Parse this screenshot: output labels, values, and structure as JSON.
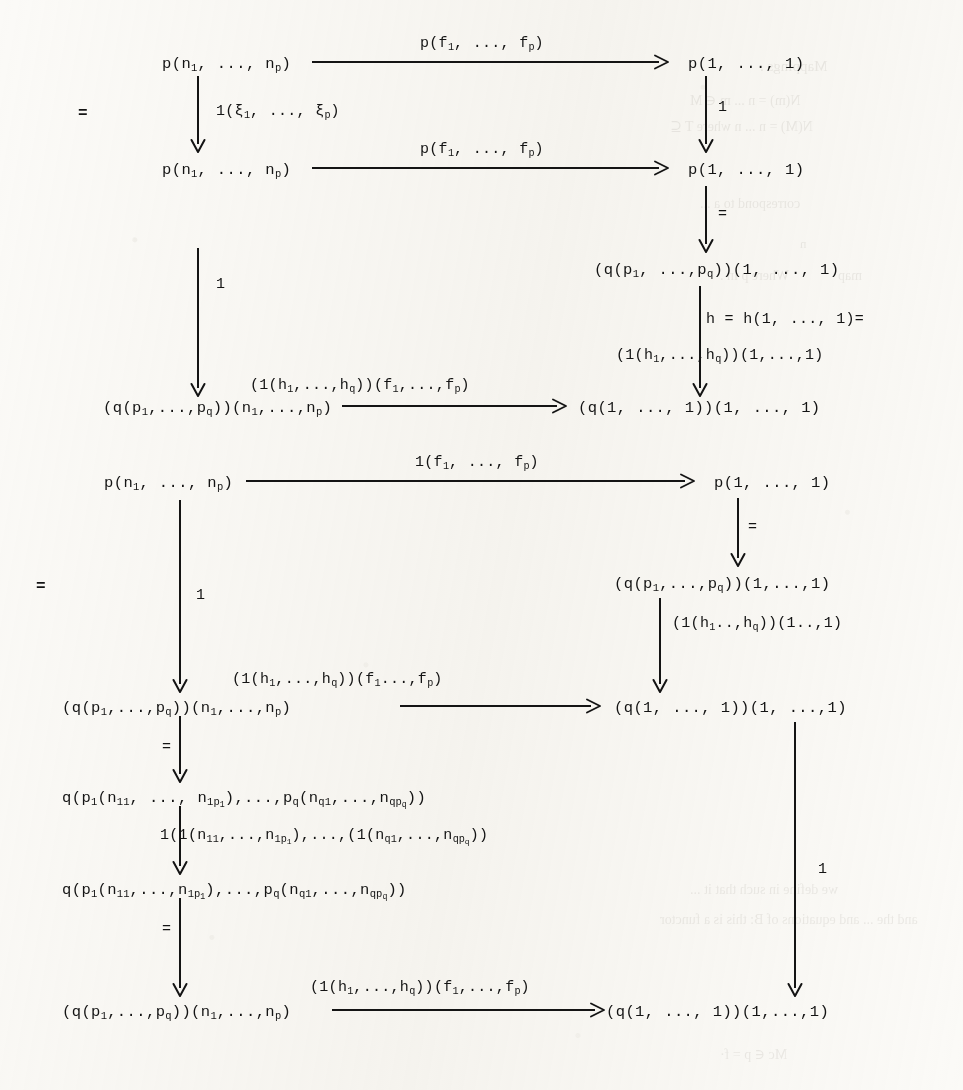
{
  "page": {
    "kind": "typewritten mathematical commutative diagram",
    "background_color": "#fbfaf7",
    "ink_color": "#141414"
  },
  "equality_marks": [
    {
      "name": "eq-left-upper",
      "text": "=",
      "x": 78,
      "y": 105
    },
    {
      "name": "eq-left-lower",
      "text": "=",
      "x": 36,
      "y": 578
    }
  ],
  "diagram_upper": {
    "nodes": [
      {
        "id": "u-tl",
        "text": "p(n<sub>1</sub>, ..., n<sub>p</sub>)",
        "x": 162,
        "y": 56
      },
      {
        "id": "u-tr",
        "text": "p(1, ..., 1)",
        "x": 688,
        "y": 56
      },
      {
        "id": "u-ml",
        "text": "p(n<sub>1</sub>, ..., n<sub>p</sub>)",
        "x": 162,
        "y": 162
      },
      {
        "id": "u-mr",
        "text": "p(1, ..., 1)",
        "x": 688,
        "y": 162
      },
      {
        "id": "u-qr",
        "text": "(q(p<sub>1</sub>, ...,p<sub>q</sub>))(1, ..., 1)",
        "x": 594,
        "y": 262
      },
      {
        "id": "u-bl",
        "text": "(q(p<sub>1</sub>,...,p<sub>q</sub>))(n<sub>1</sub>,...,n<sub>p</sub>)",
        "x": 103,
        "y": 400
      },
      {
        "id": "u-br",
        "text": "(q(1, ..., 1))(1, ..., 1)",
        "x": 578,
        "y": 400
      }
    ],
    "labels": [
      {
        "id": "u-top-arrow-label",
        "text": "p(f<sub>1</sub>, ..., f<sub>p</sub>)",
        "x": 420,
        "y": 36
      },
      {
        "id": "u-xi-label",
        "text": "1(ξ<sub>1</sub>, ..., ξ<sub>p</sub>)",
        "x": 216,
        "y": 104
      },
      {
        "id": "u-mid-arrow-label",
        "text": "p(f<sub>1</sub>, ..., f<sub>p</sub>)",
        "x": 420,
        "y": 142
      },
      {
        "id": "u-right-one",
        "text": "1",
        "x": 718,
        "y": 100
      },
      {
        "id": "u-left-one",
        "text": "1",
        "x": 216,
        "y": 277
      },
      {
        "id": "u-h-label-a",
        "text": "h = h(1, ..., 1)=",
        "x": 706,
        "y": 312
      },
      {
        "id": "u-h-label-b",
        "text": "(1(h<sub>1</sub>,...,h<sub>q</sub>))(1,...,1)",
        "x": 616,
        "y": 348
      },
      {
        "id": "u-bot-arrow-label",
        "text": "(1(h<sub>1</sub>,...,h<sub>q</sub>))(f<sub>1</sub>,...,f<sub>p</sub>)",
        "x": 250,
        "y": 378
      },
      {
        "id": "u-eq-right-1",
        "text": "=",
        "x": 718,
        "y": 207
      }
    ]
  },
  "diagram_lower": {
    "nodes": [
      {
        "id": "l-tl",
        "text": "p(n<sub>1</sub>, ..., n<sub>p</sub>)",
        "x": 104,
        "y": 475
      },
      {
        "id": "l-tr",
        "text": "p(1, ..., 1)",
        "x": 714,
        "y": 475
      },
      {
        "id": "l-qr",
        "text": "(q(p<sub>1</sub>,...,p<sub>q</sub>))(1,...,1)",
        "x": 614,
        "y": 576
      },
      {
        "id": "l-ml",
        "text": "(q(p<sub>1</sub>,...,p<sub>q</sub>))(n<sub>1</sub>,...,n<sub>p</sub>)",
        "x": 62,
        "y": 700
      },
      {
        "id": "l-mr",
        "text": "(q(1, ..., 1))(1, ...,1)",
        "x": 614,
        "y": 700
      },
      {
        "id": "l-n1",
        "text": "q(p<sub>1</sub>(n<sub>11</sub>, ..., n<sub>1p<sub>1</sub></sub>),...,p<sub>q</sub>(n<sub>q1</sub>,...,n<sub>qp<sub>q</sub></sub>))",
        "x": 62,
        "y": 790
      },
      {
        "id": "l-n2",
        "text": "q(p<sub>1</sub>(n<sub>11</sub>,...,n<sub>1p<sub>1</sub></sub>),...,p<sub>q</sub>(n<sub>q1</sub>,...,n<sub>qp<sub>q</sub></sub>))",
        "x": 62,
        "y": 882
      },
      {
        "id": "l-bl",
        "text": "(q(p<sub>1</sub>,...,p<sub>q</sub>))(n<sub>1</sub>,...,n<sub>p</sub>)",
        "x": 62,
        "y": 1004
      },
      {
        "id": "l-br",
        "text": "(q(1, ..., 1))(1,...,1)",
        "x": 606,
        "y": 1004
      }
    ],
    "labels": [
      {
        "id": "l-top-arrow-label",
        "text": "1(f<sub>1</sub>, ..., f<sub>p</sub>)",
        "x": 415,
        "y": 455
      },
      {
        "id": "l-left-one",
        "text": "1",
        "x": 196,
        "y": 588
      },
      {
        "id": "l-eq-right-1",
        "text": "=",
        "x": 748,
        "y": 520
      },
      {
        "id": "l-h1-label",
        "text": "(1(h<sub>1</sub>..,h<sub>q</sub>))(1..,1)",
        "x": 672,
        "y": 616
      },
      {
        "id": "l-mid-arrow-label",
        "text": "(1(h<sub>1</sub>,...,h<sub>q</sub>))(f<sub>1</sub>...,f<sub>p</sub>)",
        "x": 232,
        "y": 672
      },
      {
        "id": "l-eq-a",
        "text": "=",
        "x": 162,
        "y": 740
      },
      {
        "id": "l-1n-label",
        "text": "1(1(n<sub>11</sub>,...,n<sub>1p<sub>1</sub></sub>),...,(1(n<sub>q1</sub>,...,n<sub>qp<sub>q</sub></sub>))",
        "x": 160,
        "y": 828
      },
      {
        "id": "l-eq-b",
        "text": "=",
        "x": 162,
        "y": 922
      },
      {
        "id": "l-bot-arrow-label",
        "text": "(1(h<sub>1</sub>,...,h<sub>q</sub>))(f<sub>1</sub>,...,f<sub>p</sub>)",
        "x": 310,
        "y": 980
      },
      {
        "id": "l-right-one",
        "text": "1",
        "x": 818,
        "y": 862
      }
    ]
  },
  "arrows": {
    "horizontal": [
      {
        "id": "u-arrow-top",
        "x1": 312,
        "y1": 62,
        "x2": 668,
        "y2": 62,
        "head": true
      },
      {
        "id": "u-arrow-mid",
        "x1": 312,
        "y1": 168,
        "x2": 668,
        "y2": 168,
        "head": true
      },
      {
        "id": "u-arrow-bot",
        "x1": 342,
        "y1": 406,
        "x2": 566,
        "y2": 406,
        "head": true
      },
      {
        "id": "l-arrow-top",
        "x1": 246,
        "y1": 481,
        "x2": 694,
        "y2": 481,
        "head": true
      },
      {
        "id": "l-arrow-mid",
        "x1": 400,
        "y1": 706,
        "x2": 600,
        "y2": 706,
        "head": true
      },
      {
        "id": "l-arrow-bot",
        "x1": 332,
        "y1": 1010,
        "x2": 604,
        "y2": 1010,
        "head": true
      }
    ],
    "vertical": [
      {
        "id": "u-v-xi",
        "x": 198,
        "y1": 76,
        "y2": 152,
        "head": true
      },
      {
        "id": "u-v-right-1",
        "x": 706,
        "y1": 76,
        "y2": 152,
        "head": true
      },
      {
        "id": "u-v-left-1",
        "x": 198,
        "y1": 248,
        "y2": 396,
        "head": true
      },
      {
        "id": "u-v-right-eq",
        "x": 706,
        "y1": 186,
        "y2": 252,
        "head": true
      },
      {
        "id": "u-v-h",
        "x": 700,
        "y1": 286,
        "y2": 396,
        "head": true
      },
      {
        "id": "l-v-left-1",
        "x": 180,
        "y1": 500,
        "y2": 692,
        "head": true
      },
      {
        "id": "l-v-right-eq",
        "x": 738,
        "y1": 498,
        "y2": 566,
        "head": true
      },
      {
        "id": "l-v-h1",
        "x": 660,
        "y1": 598,
        "y2": 692,
        "head": true
      },
      {
        "id": "l-v-a",
        "x": 180,
        "y1": 716,
        "y2": 782,
        "head": true
      },
      {
        "id": "l-v-b",
        "x": 180,
        "y1": 806,
        "y2": 874,
        "head": true
      },
      {
        "id": "l-v-c",
        "x": 180,
        "y1": 898,
        "y2": 996,
        "head": true
      },
      {
        "id": "l-v-right-long",
        "x": 795,
        "y1": 722,
        "y2": 996,
        "head": true
      }
    ]
  },
  "bleed_through": [
    {
      "text": "Mappings .",
      "x": 760,
      "y": 58,
      "size": 15
    },
    {
      "text": "N(m) = n ... m ∈ M",
      "x": 690,
      "y": 92,
      "size": 14
    },
    {
      "text": "N(M) = n      ...  n        where  T ⊆",
      "x": 670,
      "y": 118,
      "size": 14
    },
    {
      "text": "correspond  to  a ...",
      "x": 700,
      "y": 196,
      "size": 14
    },
    {
      "text": "n",
      "x": 800,
      "y": 236,
      "size": 13
    },
    {
      "text": "Where p in .",
      "x": 720,
      "y": 268,
      "size": 14
    },
    {
      "text": "map",
      "x": 838,
      "y": 268,
      "size": 14
    },
    {
      "text": "we define  in  such that  it  ...",
      "x": 690,
      "y": 882,
      "size": 14
    },
    {
      "text": "and  the  ... and  equations  of  B:      this  is  a  functor",
      "x": 660,
      "y": 912,
      "size": 14
    },
    {
      "text": "Mc ∈ p = f·",
      "x": 720,
      "y": 1046,
      "size": 14
    }
  ]
}
